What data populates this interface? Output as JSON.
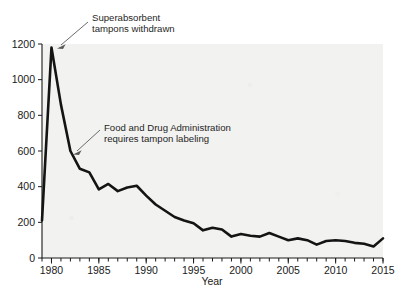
{
  "chart_data": {
    "type": "line",
    "title": "",
    "subtitle": "",
    "xlabel": "Year",
    "ylabel": "",
    "xlim": [
      1979,
      2015
    ],
    "ylim": [
      0,
      1200
    ],
    "grid": false,
    "legend_position": "none",
    "x_ticks": [
      1980,
      1985,
      1990,
      1995,
      2000,
      2005,
      2010,
      2015
    ],
    "x_tick_labels": [
      "1980",
      "1985",
      "1990",
      "1995",
      "2000",
      "2005",
      "2010",
      "2015"
    ],
    "x_minor_tick_step": 1,
    "y_ticks": [
      0,
      200,
      400,
      600,
      800,
      1000,
      1200
    ],
    "y_tick_labels": [
      "0",
      "200",
      "400",
      "600",
      "800",
      "1000",
      "1200"
    ],
    "series": [
      {
        "name": "Reported cases",
        "color": "#141414",
        "x": [
          1979,
          1980,
          1981,
          1982,
          1983,
          1984,
          1985,
          1986,
          1987,
          1988,
          1989,
          1990,
          1991,
          1992,
          1993,
          1994,
          1995,
          1996,
          1997,
          1998,
          1999,
          2000,
          2001,
          2002,
          2003,
          2004,
          2005,
          2006,
          2007,
          2008,
          2009,
          2010,
          2011,
          2012,
          2013,
          2014,
          2015
        ],
        "values": [
          210,
          1180,
          860,
          600,
          500,
          480,
          385,
          415,
          375,
          395,
          405,
          350,
          300,
          265,
          230,
          210,
          195,
          155,
          170,
          160,
          120,
          135,
          125,
          120,
          140,
          120,
          100,
          110,
          100,
          75,
          95,
          100,
          95,
          85,
          80,
          65,
          110
        ]
      }
    ],
    "annotations": [
      {
        "id": "annotation-superabsorbent",
        "lines": [
          "Superabsorbent",
          "tampons withdrawn"
        ],
        "points_to_year": 1980,
        "points_to_value": 1180
      },
      {
        "id": "annotation-fda-labeling",
        "lines": [
          "Food and Drug Administration",
          "requires tampon labeling"
        ],
        "points_to_year": 1982,
        "points_to_value": 600
      }
    ]
  },
  "colors": {
    "series": "#141414",
    "plot_background": "#f2f2f0",
    "axis": "#1a1a1a",
    "annotation_leader": "#5a5a5a",
    "text": "#1a1a1a"
  }
}
